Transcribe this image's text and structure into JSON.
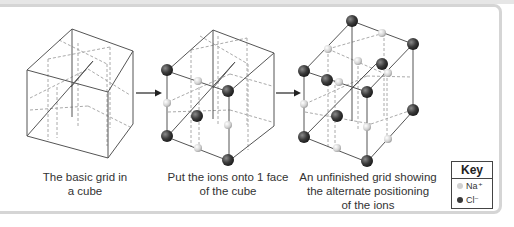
{
  "figure": {
    "panels": [
      {
        "id": "basic-grid",
        "caption_line1": "The basic grid in",
        "caption_line2": "a cube"
      },
      {
        "id": "ions-on-face",
        "caption_line1": "Put the ions onto 1 face",
        "caption_line2": "of the cube"
      },
      {
        "id": "unfinished-grid",
        "caption_line1": "An unfinished grid showing",
        "caption_line2": "the alternate positioning",
        "caption_line3": "of the ions"
      }
    ],
    "key": {
      "title": "Key",
      "items": [
        {
          "label": "Na⁺",
          "color": "#d0d0d0"
        },
        {
          "label": "Cl⁻",
          "color": "#3a3a3a"
        }
      ]
    },
    "colors": {
      "lines": "#555555",
      "dashed": "#aaaaaa",
      "frame": "#d5d5d5",
      "na_ion": "#d0d0d0",
      "cl_ion": "#3a3a3a"
    }
  }
}
